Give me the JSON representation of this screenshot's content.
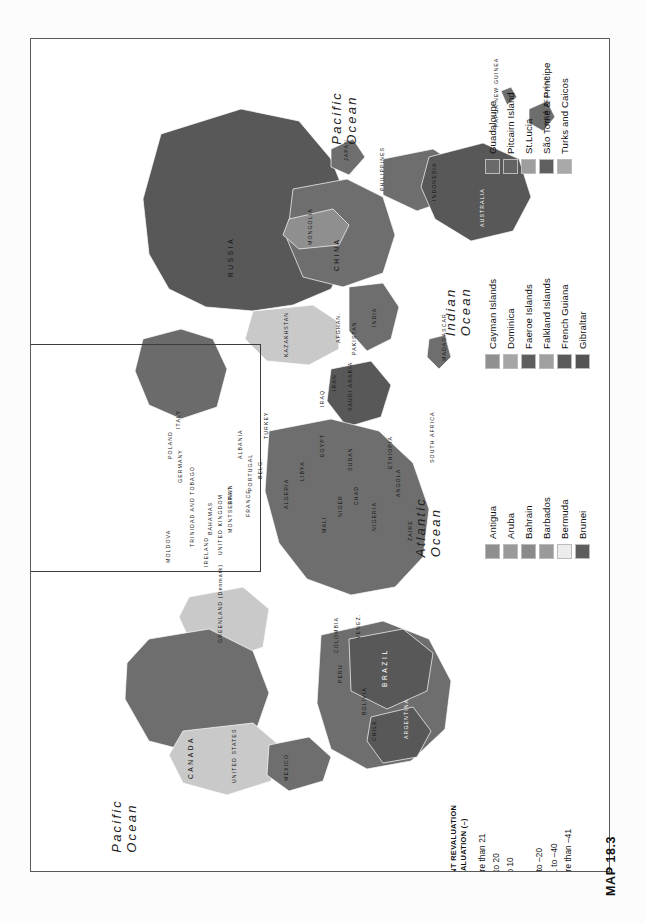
{
  "page": {
    "caption": "MAP 18.3",
    "background_color": "#fcfcfc"
  },
  "map": {
    "orientation": "rotated-90-ccw",
    "frame_color": "#5a5a5a",
    "ocean_labels": [
      {
        "name": "pacific-ocean-north",
        "line1": "Pacific",
        "line2": "Ocean"
      },
      {
        "name": "indian-ocean",
        "line1": "Indian",
        "line2": "Ocean"
      },
      {
        "name": "atlantic-ocean",
        "line1": "Atlantic",
        "line2": "Ocean"
      },
      {
        "name": "pacific-ocean-south",
        "line1": "Pacific",
        "line2": "Ocean"
      }
    ],
    "major_country_labels": [
      "RUSSIA",
      "CHINA",
      "INDIA",
      "AUSTRALIA",
      "CANADA",
      "UNITED STATES",
      "BRAZIL",
      "MEXICO",
      "GREENLAND (Denmark)",
      "MONGOLIA",
      "KAZAKHSTAN",
      "TURKEY",
      "EGYPT",
      "SUDAN",
      "LIBYA",
      "ALGERIA",
      "NIGER",
      "CHAD",
      "MALI",
      "ANGOLA",
      "SOUTH AFRICA",
      "ARGENTINA",
      "CHILE",
      "PERU",
      "BOLIVIA",
      "COLOMBIA",
      "VENEZ.",
      "IRAN",
      "IRAQ",
      "SAUDI ARABIA",
      "PAKISTAN",
      "AFGHAN.",
      "INDONESIA",
      "PHILIPPINES",
      "JAPAN",
      "NEW ZEALAND",
      "PAPUA NEW GUINEA",
      "MADAGASCAR",
      "ETHIOPIA",
      "NAMIBIA",
      "BOTSWANA",
      "ZAMBIA",
      "TANZANIA",
      "KENYA",
      "NIGERIA",
      "CAMEROON",
      "GABON",
      "ZAIRE",
      "MOZAMBIQUE",
      "ZIMBABWE",
      "SOMALIA",
      "MAURITANIA",
      "MOROCCO",
      "TUNISIA",
      "SENEGAL",
      "GUINEA",
      "GHANA",
      "CÔTE d'IVOIRE",
      "LIBERIA",
      "SIERRA LEONE",
      "BURKINA",
      "TOGO",
      "BENIN",
      "CAPE VERDE",
      "GAMBIA",
      "GUINEA-BISSAU",
      "WESTERN SAHARA",
      "MYANMAR",
      "THAILAND",
      "VIETNAM",
      "LAOS",
      "CAMBODIA",
      "MALAYSIA",
      "SINGAPORE",
      "SRI LANKA",
      "NEPAL",
      "BHUTAN",
      "BANGLADESH",
      "NORTH KOREA",
      "SOUTH KOREA",
      "TAIWAN",
      "UZBEK.",
      "TURKMEN.",
      "KYRGYZSTAN",
      "TAJIKISTAN",
      "AZER.",
      "ARMENIA",
      "GEORGIA",
      "SYRIA",
      "JORDAN",
      "ISRAEL",
      "LEBANON",
      "KUWAIT",
      "QATAR",
      "U.A.E.",
      "OMAN",
      "YEMEN",
      "ERITREA",
      "DJIBOUTI",
      "UGANDA",
      "RWANDA",
      "BURUNDI",
      "MALAWI",
      "LESOTHO",
      "SWAZILAND",
      "CONGO",
      "C. AFRICAN REPUBLIC",
      "EQUAT. GUINEA",
      "SURINAME",
      "GUYANA",
      "FRENCH GUIANA",
      "ECUADOR",
      "PARAGUAY",
      "URUGUAY",
      "PANAMA",
      "COSTA RICA",
      "NICARAGUA",
      "HONDURAS",
      "EL SALVADOR",
      "GUATEMALA",
      "BELIZE",
      "CUBA",
      "HAITI",
      "DOMINICAN REP.",
      "JAMAICA",
      "PUERTO RICO",
      "BAHAMAS",
      "TRINIDAD AND TOBAGO",
      "MONTSERRAT",
      "UNITED KINGDOM",
      "IRELAND",
      "FRANCE",
      "SPAIN",
      "PORTUGAL",
      "GERMANY",
      "POLAND",
      "ITALY",
      "NORWAY",
      "SWEDEN",
      "FINLAND",
      "DENMARK",
      "NETH.",
      "BELG.",
      "LUX.",
      "SWITZ.",
      "AUSTRIA",
      "CZECH",
      "SLOVAKIA",
      "HUNGARY",
      "ROM.",
      "BULG.",
      "GREECE",
      "ALBANIA",
      "MACEDONIA",
      "YUGO.",
      "CROATIA",
      "SLOVENIA",
      "BOS.",
      "UKRAINE",
      "BELARUS",
      "MOLDOVA",
      "LITHUANIA",
      "LATVIA",
      "ESTONIA",
      "ICELAND",
      "MALTA",
      "CYP.",
      "PHILIPPINES",
      "BRUNEI",
      "FIJI",
      "VANUATU",
      "SOLOMON ISLANDS",
      "NEW CALEDONIA",
      "KIRIBATI",
      "TUVALU",
      "TONGA",
      "SAMOA",
      "NAURU",
      "PALAU",
      "GUAM",
      "MARSHALL ISLANDS",
      "FED. STATES OF MICRONESIA",
      "SEYCHELLES",
      "MALDIVES",
      "MAURITIUS",
      "COMOROS",
      "FAEROE ISLANDS"
    ]
  },
  "main_legend": {
    "name": "percent-revaluation-legend",
    "title_line1": "PERCENT REVALUATION",
    "title_line2": "OR DEVALUATION (–)",
    "items": [
      {
        "label": "More than 21",
        "color": "#585858"
      },
      {
        "label": "11 to 20",
        "color": "#c9c9c9"
      },
      {
        "label": "1 to 10",
        "color": "#6b6b6b"
      },
      {
        "label": "0",
        "color": "#9b9b9b"
      },
      {
        "label": "–1 to –20",
        "color": "#ebebeb"
      },
      {
        "label": "–21 to –40",
        "color": "#a8a8a8"
      },
      {
        "label": "More than –41",
        "color": "#4d4d4d"
      }
    ]
  },
  "island_legends": [
    {
      "name": "island-legend-a",
      "items": [
        {
          "label": "Antigua",
          "color": "#8f8f8f"
        },
        {
          "label": "Aruba",
          "color": "#9a9a9a"
        },
        {
          "label": "Bahrain",
          "color": "#8a8a8a"
        },
        {
          "label": "Barbados",
          "color": "#9a9a9a"
        },
        {
          "label": "Bermuda",
          "color": "#ececec"
        },
        {
          "label": "Brunei",
          "color": "#5d5d5d"
        }
      ]
    },
    {
      "name": "island-legend-b",
      "items": [
        {
          "label": "Cayman Islands",
          "color": "#909090"
        },
        {
          "label": "Dominica",
          "color": "#a6a6a6"
        },
        {
          "label": "Faeroe Islands",
          "color": "#5e5e5e"
        },
        {
          "label": "Falkland Islands",
          "color": "#a0a0a0"
        },
        {
          "label": "French Guiana",
          "color": "#5a5a5a"
        },
        {
          "label": "Gibraltar",
          "color": "#545454"
        }
      ]
    },
    {
      "name": "island-legend-c",
      "items": [
        {
          "label": "Guadaloupe",
          "color": "#6a6a6a"
        },
        {
          "label": "Pitcairn Island",
          "color": "#636363"
        },
        {
          "label": "St.Lucia",
          "color": "#9e9e9e"
        },
        {
          "label": "São Tomé & Principe",
          "color": "#5f5f5f"
        },
        {
          "label": "Turks and Caicos",
          "color": "#a9a9a9"
        }
      ]
    }
  ]
}
